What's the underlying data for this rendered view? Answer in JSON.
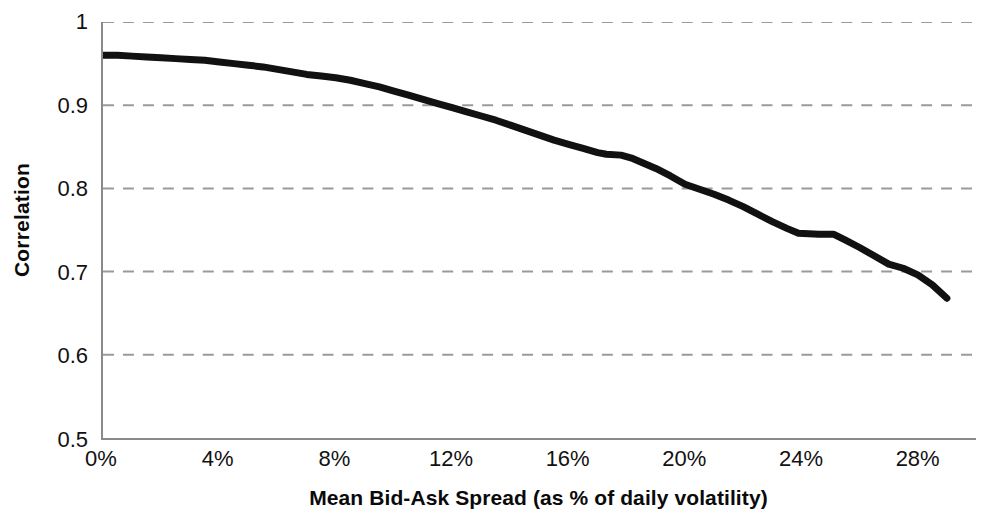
{
  "chart_data": {
    "type": "line",
    "title": "",
    "xlabel": "Mean Bid-Ask Spread (as % of daily volatility)",
    "ylabel": "Correlation",
    "xlim": [
      0,
      30
    ],
    "ylim": [
      0.5,
      1.0
    ],
    "xtick_labels": [
      "0%",
      "4%",
      "8%",
      "12%",
      "16%",
      "20%",
      "24%",
      "28%"
    ],
    "xtick_values": [
      0,
      4,
      8,
      12,
      16,
      20,
      24,
      28
    ],
    "ytick_labels": [
      "1",
      "0.9",
      "0.8",
      "0.7",
      "0.6",
      "0.5"
    ],
    "ytick_values": [
      1.0,
      0.9,
      0.8,
      0.7,
      0.6,
      0.5
    ],
    "grid": "horizontal-dashed",
    "grid_color": "#9a9a9a",
    "legend": "none",
    "line_color": "#111111",
    "line_width": 7,
    "axis_color": "#8a8a8a",
    "background": "#ffffff",
    "series": [
      {
        "name": "Correlation",
        "x": [
          0.0,
          0.5,
          1.0,
          1.5,
          2.0,
          2.5,
          3.0,
          3.5,
          4.0,
          4.5,
          5.0,
          5.5,
          6.0,
          6.5,
          7.0,
          7.5,
          8.0,
          8.5,
          9.0,
          9.5,
          10.0,
          10.5,
          11.0,
          11.5,
          12.0,
          12.5,
          13.0,
          13.5,
          14.0,
          14.5,
          15.0,
          15.5,
          16.0,
          16.5,
          17.0,
          17.3,
          17.8,
          18.2,
          18.6,
          19.0,
          19.5,
          20.0,
          20.5,
          21.0,
          21.5,
          22.0,
          22.5,
          23.0,
          23.5,
          23.9,
          24.6,
          25.1,
          25.5,
          26.0,
          26.5,
          27.0,
          27.5,
          28.0,
          28.5,
          29.0
        ],
        "y": [
          0.96,
          0.96,
          0.959,
          0.958,
          0.957,
          0.956,
          0.955,
          0.954,
          0.952,
          0.95,
          0.948,
          0.946,
          0.943,
          0.94,
          0.937,
          0.935,
          0.933,
          0.93,
          0.926,
          0.922,
          0.917,
          0.912,
          0.907,
          0.902,
          0.897,
          0.892,
          0.887,
          0.882,
          0.876,
          0.87,
          0.864,
          0.858,
          0.853,
          0.848,
          0.843,
          0.841,
          0.84,
          0.836,
          0.83,
          0.824,
          0.815,
          0.805,
          0.799,
          0.793,
          0.786,
          0.778,
          0.769,
          0.76,
          0.752,
          0.746,
          0.745,
          0.745,
          0.738,
          0.729,
          0.719,
          0.709,
          0.704,
          0.696,
          0.684,
          0.668
        ]
      }
    ]
  }
}
